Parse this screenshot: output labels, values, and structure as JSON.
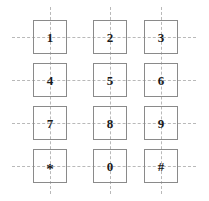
{
  "canvas": {
    "width": 209,
    "height": 201,
    "background": "#ffffff"
  },
  "style": {
    "key_border_color": "#8a8a8a",
    "guide_line_color": "#b9b9b9",
    "label_color": "#1a1a1a",
    "key_size": 34,
    "guide_dash": "dashed"
  },
  "layout": {
    "column_centers": [
      50,
      110,
      161
    ],
    "row_centers": [
      37,
      80,
      123,
      166
    ],
    "guide_h_start": 12,
    "guide_h_end": 196,
    "guide_v_start": 7,
    "guide_v_end": 194
  },
  "keypad": {
    "rows": [
      {
        "keys": [
          {
            "label": "1",
            "name": "key-1",
            "row": 0,
            "col": 0
          },
          {
            "label": "2",
            "name": "key-2",
            "row": 0,
            "col": 1
          },
          {
            "label": "3",
            "name": "key-3",
            "row": 0,
            "col": 2
          }
        ]
      },
      {
        "keys": [
          {
            "label": "4",
            "name": "key-4",
            "row": 1,
            "col": 0
          },
          {
            "label": "5",
            "name": "key-5",
            "row": 1,
            "col": 1
          },
          {
            "label": "6",
            "name": "key-6",
            "row": 1,
            "col": 2
          }
        ]
      },
      {
        "keys": [
          {
            "label": "7",
            "name": "key-7",
            "row": 2,
            "col": 0
          },
          {
            "label": "8",
            "name": "key-8",
            "row": 2,
            "col": 1
          },
          {
            "label": "9",
            "name": "key-9",
            "row": 2,
            "col": 2
          }
        ]
      },
      {
        "keys": [
          {
            "label": "*",
            "name": "key-star",
            "row": 3,
            "col": 0
          },
          {
            "label": "0",
            "name": "key-0",
            "row": 3,
            "col": 1
          },
          {
            "label": "#",
            "name": "key-hash",
            "row": 3,
            "col": 2
          }
        ]
      }
    ]
  }
}
